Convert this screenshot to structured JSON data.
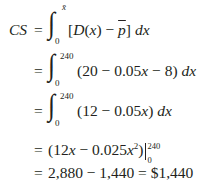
{
  "equation": {
    "line1": {
      "lhs": "CS",
      "eq": "=",
      "integral": "∫",
      "upper_limit": "x̄",
      "lower_limit": "0",
      "integrand": "[D(x) − p̄] dx"
    },
    "line2": {
      "eq": "=",
      "integral": "∫",
      "upper_limit": "240",
      "lower_limit": "0",
      "integrand": "(20 − 0.05x − 8) dx"
    },
    "line3": {
      "eq": "=",
      "integral": "∫",
      "upper_limit": "240",
      "lower_limit": "0",
      "integrand": "(12 − 0.05x) dx"
    },
    "line4": {
      "eq": "=",
      "antiderivative_open": "(12x − 0.025x",
      "exponent": "2",
      "antiderivative_close": ")",
      "eval_upper": "240",
      "eval_lower": "0"
    },
    "line5": {
      "eq": "=",
      "result": "2,880 − 1,440 = $1,440"
    }
  }
}
